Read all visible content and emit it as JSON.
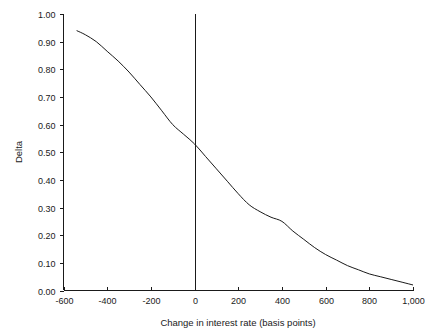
{
  "chart_data": {
    "type": "line",
    "title": "",
    "xlabel": "Change in interest rate (basis points)",
    "ylabel": "Delta",
    "xlim": [
      -600,
      1000
    ],
    "ylim": [
      0.0,
      1.0
    ],
    "grid": false,
    "legend": "none",
    "xticks": [
      -600,
      -400,
      -200,
      0,
      200,
      400,
      600,
      800,
      1000
    ],
    "xtick_labels": [
      "-600",
      "-400",
      "-200",
      "0",
      "200",
      "400",
      "600",
      "800",
      "1,000"
    ],
    "yticks": [
      0.0,
      0.1,
      0.2,
      0.3,
      0.4,
      0.5,
      0.6,
      0.7,
      0.8,
      0.9,
      1.0
    ],
    "ytick_labels": [
      "0.00",
      "0.10",
      "0.20",
      "0.30",
      "0.40",
      "0.50",
      "0.60",
      "0.70",
      "0.80",
      "0.90",
      "1.00"
    ],
    "series": [
      {
        "name": "Delta",
        "color": "#1a1a1a",
        "x": [
          -540,
          -500,
          -450,
          -400,
          -350,
          -300,
          -250,
          -200,
          -150,
          -100,
          -50,
          0,
          50,
          100,
          150,
          200,
          250,
          300,
          350,
          400,
          450,
          500,
          550,
          600,
          650,
          700,
          750,
          800,
          850,
          900,
          950,
          1000
        ],
        "values": [
          0.94,
          0.925,
          0.9,
          0.865,
          0.83,
          0.79,
          0.745,
          0.7,
          0.65,
          0.6,
          0.565,
          0.53,
          0.485,
          0.44,
          0.395,
          0.35,
          0.31,
          0.285,
          0.265,
          0.25,
          0.215,
          0.185,
          0.155,
          0.13,
          0.11,
          0.09,
          0.075,
          0.06,
          0.05,
          0.04,
          0.03,
          0.02
        ]
      }
    ],
    "annotations": [
      {
        "name": "zero-reference-line",
        "type": "vertical-line",
        "x": 0,
        "y_from": 0.0,
        "y_to": 1.0,
        "color": "#1a1a1a"
      }
    ]
  },
  "colors": {
    "background": "#ffffff",
    "ink": "#1a1a1a"
  }
}
